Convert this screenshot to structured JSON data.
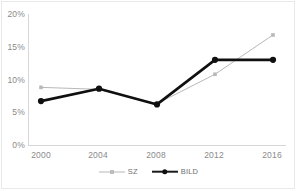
{
  "chart_data": {
    "type": "line",
    "title": "",
    "subtitle": "",
    "xlabel": "",
    "ylabel": "",
    "categories": [
      "2000",
      "2004",
      "2008",
      "2012",
      "2016"
    ],
    "x": [
      2000,
      2004,
      2008,
      2012,
      2016
    ],
    "series": [
      {
        "name": "SZ",
        "values": [
          8.8,
          8.5,
          6.3,
          10.8,
          16.8
        ],
        "color": "#b8b8b8",
        "marker": "square",
        "line_width": 1
      },
      {
        "name": "BILD",
        "values": [
          6.7,
          8.6,
          6.2,
          13.0,
          13.0
        ],
        "color": "#101010",
        "marker": "circle",
        "line_width": 2.6
      }
    ],
    "ylim": [
      0,
      20
    ],
    "yticks": [
      0,
      5,
      10,
      15,
      20
    ],
    "ytick_labels": [
      "0%",
      "5%",
      "10%",
      "15%",
      "20%"
    ],
    "grid": false,
    "legend_position": "bottom",
    "value_suffix": "%"
  },
  "axes": {
    "y_labels": [
      "20%",
      "15%",
      "10%",
      "5%",
      "0%"
    ],
    "x_labels": [
      "2000",
      "2004",
      "2008",
      "2012",
      "2016"
    ]
  },
  "legend": {
    "items": [
      {
        "label": "SZ",
        "marker_name": "sz-legend-marker"
      },
      {
        "label": "BILD",
        "marker_name": "bild-legend-marker"
      }
    ]
  }
}
